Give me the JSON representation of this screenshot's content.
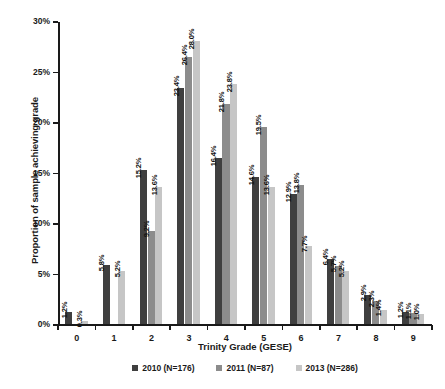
{
  "chart_data": {
    "type": "bar",
    "title": "",
    "xlabel": "Trinity Grade (GESE)",
    "ylabel": "Proportion of sample achieving grade",
    "categories": [
      "0",
      "1",
      "2",
      "3",
      "4",
      "5",
      "6",
      "7",
      "8",
      "9"
    ],
    "ylim": [
      0,
      30
    ],
    "ytick_labels": [
      "0%",
      "5%",
      "10%",
      "15%",
      "20%",
      "25%",
      "30%"
    ],
    "ytick_values": [
      0,
      5,
      10,
      15,
      20,
      25,
      30
    ],
    "grid": false,
    "legend_position": "bottom",
    "series": [
      {
        "name": "2010 (N=176)",
        "color": "#3f3f3f",
        "values": [
          1.2,
          5.8,
          15.2,
          23.4,
          16.4,
          14.6,
          12.9,
          6.4,
          2.9,
          1.2
        ],
        "labels": [
          "1.2%",
          "5.8%",
          "15.2%",
          "23.4%",
          "16.4%",
          "14.6%",
          "12.9%",
          "6.4%",
          "2.9%",
          "1.2%"
        ]
      },
      {
        "name": "2011 (N=87)",
        "color": "#8c8c8c",
        "values": [
          null,
          null,
          9.2,
          26.4,
          21.8,
          19.5,
          13.8,
          5.7,
          2.3,
          1.1
        ],
        "labels": [
          "",
          "",
          "9.2%",
          "26.4%",
          "21.8%",
          "19.5%",
          "13.8%",
          "5.7%",
          "2.3%",
          "1.1%"
        ]
      },
      {
        "name": "2013 (N=286)",
        "color": "#c6c6c6",
        "values": [
          0.3,
          5.2,
          13.6,
          28.0,
          23.8,
          13.6,
          7.7,
          5.2,
          1.4,
          1.0
        ],
        "labels": [
          "0.3%",
          "5.2%",
          "13.6%",
          "28.0%",
          "23.8%",
          "13.6%",
          "7.7%",
          "5.2%",
          "1.4%",
          "1.0%"
        ]
      }
    ]
  }
}
